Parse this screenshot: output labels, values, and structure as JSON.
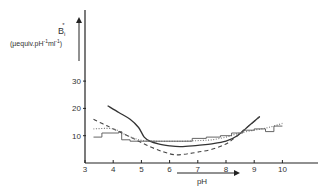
{
  "chart_data": {
    "type": "line",
    "title": "",
    "xlabel": "pH",
    "ylabel": "B_i* (µequiv.pH⁻¹ml⁻¹)",
    "ylabel_main": "Bi",
    "ylabel_sup": "*",
    "ylabel_units": "(µequiv.pH⁻¹ml⁻¹)",
    "xlim": [
      3,
      11
    ],
    "ylim": [
      0,
      45
    ],
    "xticks": [
      "3",
      "4",
      "5",
      "6",
      "7",
      "8",
      "9",
      "10"
    ],
    "yticks": [
      "10",
      "20",
      "30"
    ],
    "grid": false,
    "legend": null,
    "series": [
      {
        "name": "solid",
        "style": "solid",
        "x": [
          3.8,
          4.2,
          4.6,
          4.9,
          5.1,
          5.3,
          5.6,
          6.0,
          6.4,
          7.0,
          7.5,
          8.0,
          8.4,
          8.8,
          9.2
        ],
        "y": [
          21,
          18.5,
          16,
          13,
          9.5,
          8,
          7,
          6.3,
          6,
          6.5,
          7,
          8,
          10,
          13.5,
          17
        ]
      },
      {
        "name": "dashed",
        "style": "dashed",
        "x": [
          3.3,
          3.8,
          4.3,
          4.8,
          5.3,
          5.8,
          6.2,
          6.6,
          7.0,
          7.5,
          8.0,
          8.4,
          8.8,
          9.2
        ],
        "y": [
          16,
          13.5,
          11,
          8.5,
          6,
          4,
          3,
          3.3,
          4,
          5,
          7,
          10,
          13.5,
          17
        ]
      },
      {
        "name": "dotted",
        "style": "dotted",
        "x": [
          3.3,
          4.0,
          4.5,
          5.0,
          5.5,
          6.0,
          6.5,
          7.0,
          7.5,
          8.0,
          8.5,
          9.0,
          9.5,
          10.0
        ],
        "y": [
          12.5,
          12.5,
          10,
          8.3,
          8,
          8,
          8,
          8.2,
          8.5,
          9.5,
          11,
          12,
          13,
          14.5
        ]
      },
      {
        "name": "staircase",
        "style": "step",
        "x": [
          3.3,
          3.6,
          3.6,
          4.2,
          4.2,
          4.3,
          4.3,
          4.6,
          4.6,
          5.3,
          5.3,
          6.8,
          6.8,
          7.3,
          7.3,
          7.8,
          7.8,
          8.2,
          8.2,
          8.6,
          8.6,
          9.0,
          9.0,
          9.4,
          9.4,
          9.7,
          9.7,
          10.0
        ],
        "y": [
          9.5,
          9.5,
          11,
          11,
          11.5,
          11.5,
          8.5,
          8.5,
          8,
          8,
          8,
          8,
          9,
          9,
          9.5,
          9.5,
          10,
          10,
          11,
          11,
          12,
          12,
          12.5,
          12.5,
          11.5,
          11.5,
          13.5,
          13.5
        ]
      }
    ]
  },
  "axes": {
    "x_label": "pH",
    "y_label_main": "B",
    "y_label_sub": "i",
    "y_label_sup": "*",
    "y_label_units": "(µequiv.pH",
    "y_label_units_exp1": "-1",
    "y_label_units_mid": "ml",
    "y_label_units_exp2": "-1",
    "y_label_units_close": ")",
    "x_ticks": [
      "3",
      "4",
      "5",
      "6",
      "7",
      "8",
      "9",
      "10"
    ],
    "y_ticks": [
      "10",
      "20",
      "30"
    ]
  },
  "colors": {
    "ink": "#333333",
    "background": "#ffffff"
  }
}
